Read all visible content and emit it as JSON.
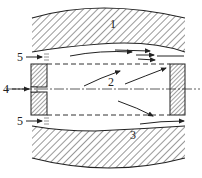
{
  "diagram": {
    "type": "cross-section schematic",
    "labels": [
      {
        "id": "1",
        "text": "1",
        "x": 111,
        "y": 27,
        "target": "upper wall"
      },
      {
        "id": "2",
        "text": "2",
        "x": 110,
        "y": 83,
        "target": "inner recirculation flow"
      },
      {
        "id": "3",
        "text": "3",
        "x": 133,
        "y": 138,
        "target": "lower annular flow"
      },
      {
        "id": "4",
        "text": "4",
        "x": 3,
        "y": 93,
        "target": "central inlet"
      },
      {
        "id": "5a",
        "text": "5",
        "x": 18,
        "y": 60,
        "target": "upper annular inlet"
      },
      {
        "id": "5b",
        "text": "5",
        "x": 18,
        "y": 121,
        "target": "lower annular inlet"
      }
    ],
    "colors": {
      "line": "#222222",
      "hatch": "#333333",
      "background": "#ffffff"
    }
  }
}
